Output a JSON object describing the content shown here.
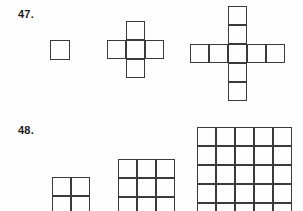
{
  "page": {
    "background_color": "#fdfdfd",
    "line_color": "#3a3a3a",
    "text_color": "#1c1c1c",
    "width": 303,
    "height": 211
  },
  "problems": [
    {
      "number": "47.",
      "pattern_type": "growing-plus-cross",
      "figures": [
        {
          "name": "figure-1",
          "description": "single square",
          "grid": 1,
          "cell_px": 20,
          "origin": {
            "x": 50,
            "y": 40
          },
          "cells": [
            [
              0,
              0
            ]
          ]
        },
        {
          "name": "figure-2",
          "description": "plus made of 5 squares on a 3x3 grid",
          "grid": 3,
          "cell_px": 19,
          "origin": {
            "x": 107,
            "y": 21
          },
          "cells": [
            [
              1,
              0
            ],
            [
              0,
              1
            ],
            [
              1,
              1
            ],
            [
              2,
              1
            ],
            [
              1,
              2
            ]
          ]
        },
        {
          "name": "figure-3",
          "description": "plus made of 13 squares on a 5x5 grid",
          "grid": 5,
          "cell_px": 19,
          "origin": {
            "x": 190,
            "y": 6
          },
          "cells": [
            [
              2,
              0
            ],
            [
              2,
              1
            ],
            [
              0,
              2
            ],
            [
              1,
              2
            ],
            [
              2,
              2
            ],
            [
              3,
              2
            ],
            [
              4,
              2
            ],
            [
              2,
              3
            ],
            [
              2,
              4
            ]
          ]
        }
      ]
    },
    {
      "number": "48.",
      "pattern_type": "growing-square-grid",
      "figures": [
        {
          "name": "figure-1",
          "description": "2 by 2 square grid",
          "grid": 2,
          "cell_px": 19,
          "origin": {
            "x": 52,
            "y": 177
          }
        },
        {
          "name": "figure-2",
          "description": "3 by 3 square grid",
          "grid": 3,
          "cell_px": 19,
          "origin": {
            "x": 118,
            "y": 159
          }
        },
        {
          "name": "figure-3",
          "description": "5 by 5 square grid",
          "grid": 5,
          "cell_px": 19,
          "origin": {
            "x": 197,
            "y": 127
          }
        }
      ]
    }
  ]
}
